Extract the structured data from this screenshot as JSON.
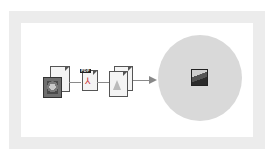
{
  "diagram": {
    "nodes": [
      {
        "id": "source",
        "icon": "photo-and-document-icon"
      },
      {
        "id": "pdf",
        "icon": "pdf-document-icon",
        "tag": "PDF"
      },
      {
        "id": "pages",
        "icon": "multi-page-document-icon"
      },
      {
        "id": "output",
        "icon": "image-file-icon"
      }
    ],
    "edges": [
      {
        "from": "source",
        "to": "pdf"
      },
      {
        "from": "pdf",
        "to": "pages"
      },
      {
        "from": "pages",
        "to": "output",
        "arrow": true
      }
    ],
    "colors": {
      "frame": "#ececec",
      "circle": "#d9d9d9",
      "connector": "#8a8a8a"
    }
  }
}
